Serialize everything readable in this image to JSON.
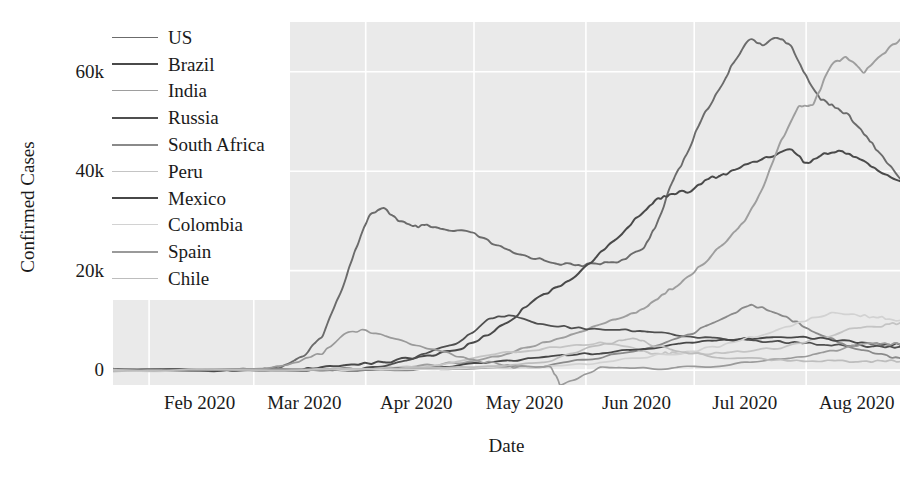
{
  "chart_data": {
    "type": "line",
    "title": "",
    "xlabel": "Date",
    "ylabel": "Confirmed Cases",
    "xtick_labels": [
      "Feb 2020",
      "Mar 2020",
      "Apr 2020",
      "May 2020",
      "Jun 2020",
      "Jul 2020",
      "Aug 2020"
    ],
    "ytick_labels": [
      "0",
      "20k",
      "40k",
      "60k"
    ],
    "ytick_values": [
      0,
      20000,
      40000,
      60000
    ],
    "ylim": [
      -3000,
      70000
    ],
    "xlim": [
      "2020-01-22",
      "2020-08-27"
    ],
    "grid": true,
    "grid_color": "#ffffff",
    "plot_background": "#eaeaea",
    "legend_position": "upper left",
    "x_month_starts": [
      "2020-02-01",
      "2020-03-01",
      "2020-04-01",
      "2020-05-01",
      "2020-06-01",
      "2020-07-01",
      "2020-08-01"
    ],
    "note": "Daily new confirmed COVID-19 cases, 7-day style smoothed curves, top 10 countries",
    "series": [
      {
        "name": "US",
        "color": "#6b6b6b",
        "width": 1.9,
        "x": [
          "2020-01-22",
          "2020-02-01",
          "2020-02-15",
          "2020-03-01",
          "2020-03-08",
          "2020-03-15",
          "2020-03-20",
          "2020-03-25",
          "2020-03-29",
          "2020-04-02",
          "2020-04-06",
          "2020-04-10",
          "2020-04-14",
          "2020-04-18",
          "2020-04-24",
          "2020-04-30",
          "2020-05-06",
          "2020-05-12",
          "2020-05-18",
          "2020-05-24",
          "2020-05-30",
          "2020-06-05",
          "2020-06-11",
          "2020-06-17",
          "2020-06-21",
          "2020-06-25",
          "2020-06-29",
          "2020-07-03",
          "2020-07-08",
          "2020-07-12",
          "2020-07-16",
          "2020-07-20",
          "2020-07-24",
          "2020-07-28",
          "2020-08-01",
          "2020-08-05",
          "2020-08-09",
          "2020-08-13",
          "2020-08-17",
          "2020-08-21",
          "2020-08-27"
        ],
        "y": [
          10,
          20,
          40,
          100,
          500,
          2800,
          7000,
          15500,
          24000,
          31200,
          32500,
          30200,
          28800,
          29000,
          28000,
          27800,
          25500,
          23500,
          22500,
          21500,
          21000,
          21500,
          22000,
          24500,
          30000,
          38000,
          43500,
          50500,
          56500,
          62000,
          66500,
          65500,
          67000,
          65000,
          59000,
          54500,
          53000,
          51000,
          47500,
          44000,
          38500
        ]
      },
      {
        "name": "Brazil",
        "color": "#4a4a4a",
        "width": 2.0,
        "x": [
          "2020-01-22",
          "2020-02-26",
          "2020-03-10",
          "2020-03-20",
          "2020-03-30",
          "2020-04-08",
          "2020-04-18",
          "2020-04-28",
          "2020-05-05",
          "2020-05-12",
          "2020-05-18",
          "2020-05-24",
          "2020-05-30",
          "2020-06-05",
          "2020-06-11",
          "2020-06-17",
          "2020-06-21",
          "2020-06-25",
          "2020-06-30",
          "2020-07-05",
          "2020-07-10",
          "2020-07-16",
          "2020-07-22",
          "2020-07-28",
          "2020-08-01",
          "2020-08-06",
          "2020-08-11",
          "2020-08-16",
          "2020-08-21",
          "2020-08-27"
        ],
        "y": [
          0,
          5,
          60,
          400,
          1300,
          1800,
          2800,
          4500,
          7200,
          10500,
          14500,
          16500,
          19500,
          23500,
          27500,
          32000,
          34500,
          35500,
          36000,
          38500,
          39500,
          41500,
          43000,
          44500,
          41500,
          43500,
          44000,
          42500,
          40000,
          38000
        ]
      },
      {
        "name": "India",
        "color": "#9e9e9e",
        "width": 1.9,
        "x": [
          "2020-01-22",
          "2020-03-01",
          "2020-03-20",
          "2020-04-01",
          "2020-04-15",
          "2020-04-30",
          "2020-05-10",
          "2020-05-20",
          "2020-05-30",
          "2020-06-08",
          "2020-06-15",
          "2020-06-20",
          "2020-06-25",
          "2020-06-30",
          "2020-07-05",
          "2020-07-10",
          "2020-07-15",
          "2020-07-20",
          "2020-07-25",
          "2020-07-30",
          "2020-08-03",
          "2020-08-08",
          "2020-08-12",
          "2020-08-17",
          "2020-08-22",
          "2020-08-27"
        ],
        "y": [
          0,
          2,
          30,
          200,
          800,
          1700,
          3200,
          5500,
          7500,
          10000,
          11500,
          14000,
          16500,
          19000,
          22500,
          26000,
          30000,
          36500,
          46000,
          53000,
          53500,
          61500,
          63000,
          60000,
          63500,
          66500
        ]
      },
      {
        "name": "Russia",
        "color": "#4f4f4f",
        "width": 1.8,
        "x": [
          "2020-01-22",
          "2020-03-15",
          "2020-03-28",
          "2020-04-08",
          "2020-04-18",
          "2020-04-28",
          "2020-05-05",
          "2020-05-12",
          "2020-05-20",
          "2020-05-30",
          "2020-06-10",
          "2020-06-20",
          "2020-06-30",
          "2020-07-10",
          "2020-07-20",
          "2020-07-31",
          "2020-08-10",
          "2020-08-20",
          "2020-08-27"
        ],
        "y": [
          0,
          30,
          200,
          1000,
          3500,
          6000,
          10500,
          11000,
          9200,
          8500,
          8200,
          7600,
          6700,
          6300,
          5800,
          5400,
          5100,
          4800,
          4700
        ]
      },
      {
        "name": "South Africa",
        "color": "#8a8a8a",
        "width": 1.8,
        "x": [
          "2020-01-22",
          "2020-03-20",
          "2020-04-10",
          "2020-05-01",
          "2020-05-20",
          "2020-06-05",
          "2020-06-20",
          "2020-07-01",
          "2020-07-10",
          "2020-07-17",
          "2020-07-24",
          "2020-07-31",
          "2020-08-07",
          "2020-08-14",
          "2020-08-21",
          "2020-08-27"
        ],
        "y": [
          0,
          30,
          100,
          350,
          800,
          2600,
          4800,
          7500,
          11000,
          13000,
          11500,
          9000,
          6500,
          4500,
          3200,
          2400
        ]
      },
      {
        "name": "Peru",
        "color": "#c4c4c4",
        "width": 1.8,
        "x": [
          "2020-01-22",
          "2020-03-15",
          "2020-04-01",
          "2020-04-20",
          "2020-05-10",
          "2020-05-25",
          "2020-06-05",
          "2020-06-15",
          "2020-06-20",
          "2020-06-25",
          "2020-07-05",
          "2020-07-15",
          "2020-07-25",
          "2020-08-05",
          "2020-08-15",
          "2020-08-22",
          "2020-08-27"
        ],
        "y": [
          0,
          20,
          200,
          900,
          3500,
          4800,
          5500,
          4200,
          3200,
          3500,
          3400,
          3600,
          4500,
          6500,
          8500,
          9000,
          9500
        ]
      },
      {
        "name": "Mexico",
        "color": "#474747",
        "width": 1.8,
        "x": [
          "2020-01-22",
          "2020-03-20",
          "2020-04-10",
          "2020-04-25",
          "2020-05-10",
          "2020-05-25",
          "2020-06-05",
          "2020-06-20",
          "2020-07-01",
          "2020-07-15",
          "2020-07-25",
          "2020-08-05",
          "2020-08-15",
          "2020-08-22",
          "2020-08-27"
        ],
        "y": [
          0,
          20,
          300,
          900,
          1900,
          2900,
          3500,
          4400,
          5500,
          6300,
          6900,
          6300,
          5600,
          5200,
          5100
        ]
      },
      {
        "name": "Colombia",
        "color": "#d2d2d2",
        "width": 1.7,
        "x": [
          "2020-01-22",
          "2020-03-20",
          "2020-04-15",
          "2020-05-10",
          "2020-05-30",
          "2020-06-15",
          "2020-06-30",
          "2020-07-10",
          "2020-07-20",
          "2020-07-30",
          "2020-08-08",
          "2020-08-16",
          "2020-08-22",
          "2020-08-27"
        ],
        "y": [
          0,
          10,
          100,
          500,
          1100,
          2500,
          3700,
          5200,
          7200,
          9500,
          11500,
          11000,
          10500,
          10000
        ]
      },
      {
        "name": "Spain",
        "color": "#9a9a9a",
        "width": 1.7,
        "x": [
          "2020-01-22",
          "2020-03-01",
          "2020-03-12",
          "2020-03-20",
          "2020-03-26",
          "2020-04-01",
          "2020-04-08",
          "2020-04-18",
          "2020-04-28",
          "2020-05-05",
          "2020-05-12",
          "2020-05-22",
          "2020-05-25",
          "2020-06-05",
          "2020-06-20",
          "2020-07-05",
          "2020-07-20",
          "2020-08-01",
          "2020-08-12",
          "2020-08-20",
          "2020-08-27"
        ],
        "y": [
          0,
          30,
          1200,
          3500,
          7300,
          8000,
          6500,
          4500,
          2500,
          1500,
          600,
          800,
          -3000,
          400,
          350,
          700,
          1800,
          2800,
          4500,
          5400,
          5200
        ]
      },
      {
        "name": "Chile",
        "color": "#bdbdbd",
        "width": 1.7,
        "x": [
          "2020-01-22",
          "2020-03-20",
          "2020-04-10",
          "2020-05-01",
          "2020-05-20",
          "2020-06-01",
          "2020-06-10",
          "2020-06-15",
          "2020-06-20",
          "2020-06-30",
          "2020-07-10",
          "2020-07-25",
          "2020-08-05",
          "2020-08-15",
          "2020-08-22",
          "2020-08-27"
        ],
        "y": [
          0,
          40,
          300,
          500,
          1500,
          4200,
          5800,
          6500,
          4800,
          3500,
          2400,
          2100,
          1800,
          1800,
          1900,
          1700
        ]
      }
    ]
  },
  "axis": {
    "ylabel": "Confirmed Cases",
    "xlabel": "Date"
  },
  "legend": {
    "items": [
      {
        "label": "US",
        "color": "#6b6b6b",
        "width": 1.9
      },
      {
        "label": "Brazil",
        "color": "#4a4a4a",
        "width": 2.4
      },
      {
        "label": "India",
        "color": "#9e9e9e",
        "width": 1.9
      },
      {
        "label": "Russia",
        "color": "#4f4f4f",
        "width": 2.4
      },
      {
        "label": "South Africa",
        "color": "#8a8a8a",
        "width": 2.0
      },
      {
        "label": "Peru",
        "color": "#c4c4c4",
        "width": 1.8
      },
      {
        "label": "Mexico",
        "color": "#474747",
        "width": 2.4
      },
      {
        "label": "Colombia",
        "color": "#d2d2d2",
        "width": 1.7
      },
      {
        "label": "Spain",
        "color": "#9a9a9a",
        "width": 2.0
      },
      {
        "label": "Chile",
        "color": "#bdbdbd",
        "width": 1.7
      }
    ]
  }
}
